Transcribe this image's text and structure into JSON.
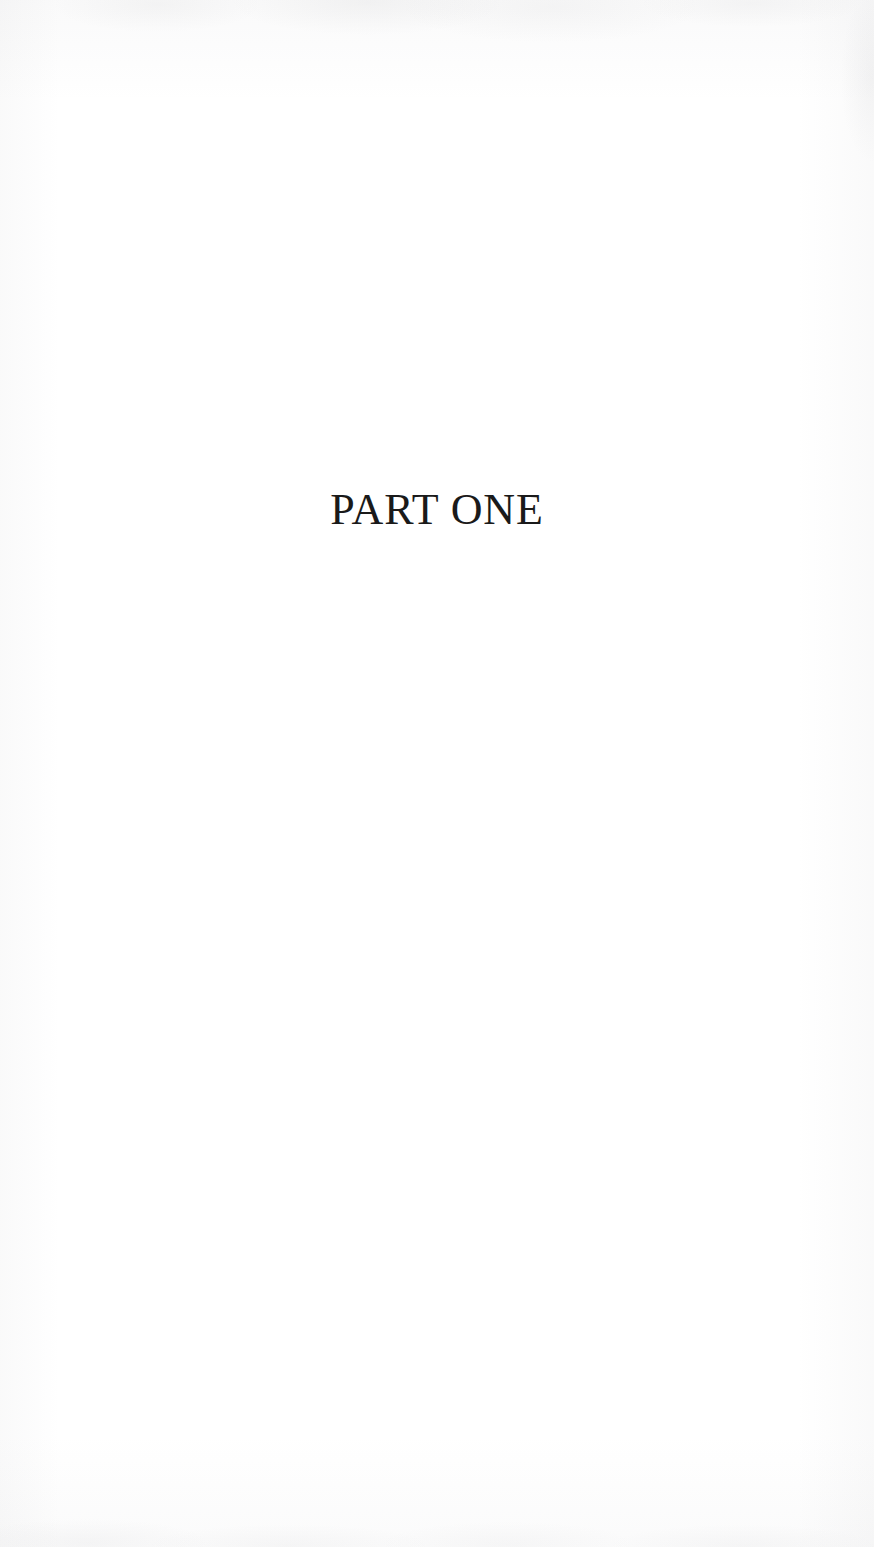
{
  "page": {
    "kind": "book-part-divider-page",
    "background_color": "#ffffff",
    "width": 874,
    "height": 1547
  },
  "content": {
    "part_title": "PART ONE",
    "title_color": "#1a1a1a",
    "title_alignment": "center"
  },
  "artifacts": {
    "top_edge_shading": "",
    "bottom_edge_shading": "",
    "left_edge_shading": "",
    "right_edge_shading": ""
  }
}
